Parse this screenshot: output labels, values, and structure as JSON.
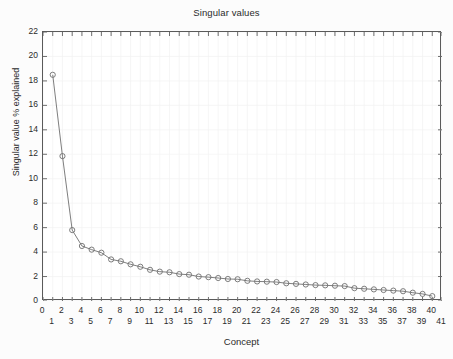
{
  "chart_data": {
    "type": "line",
    "title": "Singular values",
    "xlabel": "Concept",
    "ylabel": "Singular value % explained",
    "xlim": [
      0,
      41
    ],
    "ylim": [
      0,
      22
    ],
    "ytick_step": 2,
    "xtick_step": 1,
    "grid": true,
    "legend": "none",
    "marker": "circle-open",
    "line_color": "#6f6f6f",
    "marker_color": "#6f6f6f",
    "x": [
      1,
      2,
      3,
      4,
      5,
      6,
      7,
      8,
      9,
      10,
      11,
      12,
      13,
      14,
      15,
      16,
      17,
      18,
      19,
      20,
      21,
      22,
      23,
      24,
      25,
      26,
      27,
      28,
      29,
      30,
      31,
      32,
      33,
      34,
      35,
      36,
      37,
      38,
      39,
      40
    ],
    "xtick_labels": [
      "0",
      "1",
      "2",
      "3",
      "4",
      "5",
      "6",
      "7",
      "8",
      "9",
      "10",
      "11",
      "12",
      "13",
      "14",
      "15",
      "16",
      "17",
      "18",
      "19",
      "20",
      "21",
      "22",
      "23",
      "24",
      "25",
      "26",
      "27",
      "28",
      "29",
      "30",
      "31",
      "32",
      "33",
      "34",
      "35",
      "36",
      "37",
      "38",
      "39",
      "40",
      "41"
    ],
    "ytick_labels": [
      "0",
      "2",
      "4",
      "6",
      "8",
      "10",
      "12",
      "14",
      "16",
      "18",
      "20",
      "22"
    ],
    "values": [
      18.5,
      11.85,
      5.8,
      4.5,
      4.2,
      3.95,
      3.4,
      3.25,
      3.0,
      2.8,
      2.55,
      2.4,
      2.35,
      2.2,
      2.15,
      2.0,
      1.95,
      1.88,
      1.8,
      1.78,
      1.65,
      1.6,
      1.58,
      1.55,
      1.45,
      1.4,
      1.35,
      1.3,
      1.28,
      1.25,
      1.22,
      1.05,
      1.0,
      0.95,
      0.9,
      0.85,
      0.8,
      0.68,
      0.58,
      0.4
    ],
    "series_name": "Singular value % explained"
  }
}
